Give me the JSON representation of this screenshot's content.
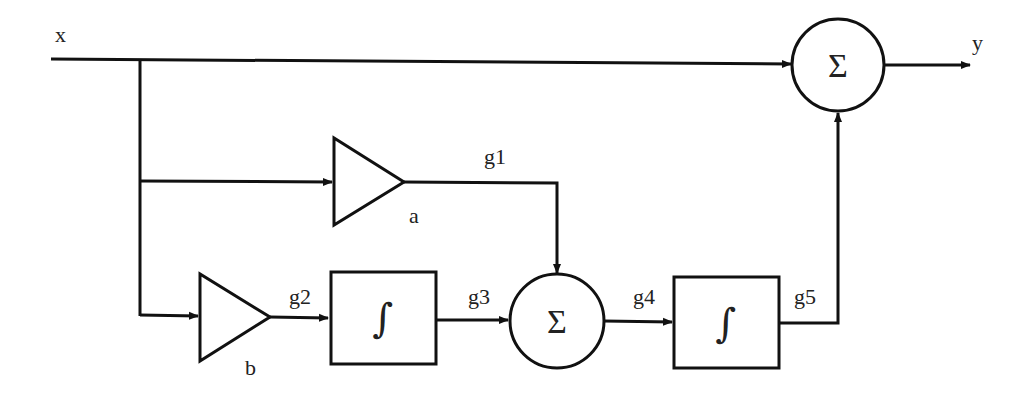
{
  "diagram": {
    "type": "block-diagram",
    "signals": {
      "input": "x",
      "output": "y",
      "g1": "g1",
      "g2": "g2",
      "g3": "g3",
      "g4": "g4",
      "g5": "g5"
    },
    "gains": {
      "a": "a",
      "b": "b"
    },
    "symbols": {
      "sum": "Σ",
      "integrator": "∫"
    },
    "blocks": [
      {
        "id": "gain-a",
        "kind": "gain",
        "label": "a",
        "input": "x",
        "output": "g1"
      },
      {
        "id": "gain-b",
        "kind": "gain",
        "label": "b",
        "input": "x",
        "output": "g2"
      },
      {
        "id": "integrator-1",
        "kind": "integrator",
        "symbol": "∫",
        "input": "g2",
        "output": "g3"
      },
      {
        "id": "sum-1",
        "kind": "summer",
        "symbol": "Σ",
        "inputs": [
          "g1",
          "g3"
        ],
        "output": "g4"
      },
      {
        "id": "integrator-2",
        "kind": "integrator",
        "symbol": "∫",
        "input": "g4",
        "output": "g5"
      },
      {
        "id": "sum-2",
        "kind": "summer",
        "symbol": "Σ",
        "inputs": [
          "x",
          "g5"
        ],
        "output": "y"
      }
    ],
    "colors": {
      "stroke": "#111111",
      "text": "#222222",
      "background": "#ffffff"
    }
  }
}
